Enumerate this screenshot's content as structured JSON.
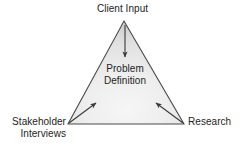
{
  "diagram": {
    "shape": "triangle",
    "center_label": "Problem\nDefinition",
    "nodes": [
      {
        "id": "client-input",
        "label": "Client Input",
        "position": "top"
      },
      {
        "id": "stakeholder-interviews",
        "label": "Stakeholder\nInterviews",
        "position": "bottom-left"
      },
      {
        "id": "research",
        "label": "Research",
        "position": "bottom-right"
      }
    ],
    "arrows": [
      {
        "id": "arrow-top",
        "from": "client-input",
        "to": "problem-definition",
        "direction": "down"
      },
      {
        "id": "arrow-left",
        "from": "stakeholder-interviews",
        "to": "problem-definition",
        "direction": "up-right"
      },
      {
        "id": "arrow-right",
        "from": "research",
        "to": "problem-definition",
        "direction": "up-left"
      }
    ],
    "colors": {
      "outline": "#4a4a4a",
      "fill_light": "#f2f2f2",
      "fill_mid": "#e0e0e0",
      "fill_dark": "#c9c9c9",
      "text": "#242424",
      "arrow": "#3a3a3a",
      "background": "#ffffff"
    },
    "geometry": {
      "apex_x": 124,
      "apex_y": 21,
      "left_x": 68,
      "left_y": 124,
      "right_x": 184,
      "right_y": 124
    }
  }
}
